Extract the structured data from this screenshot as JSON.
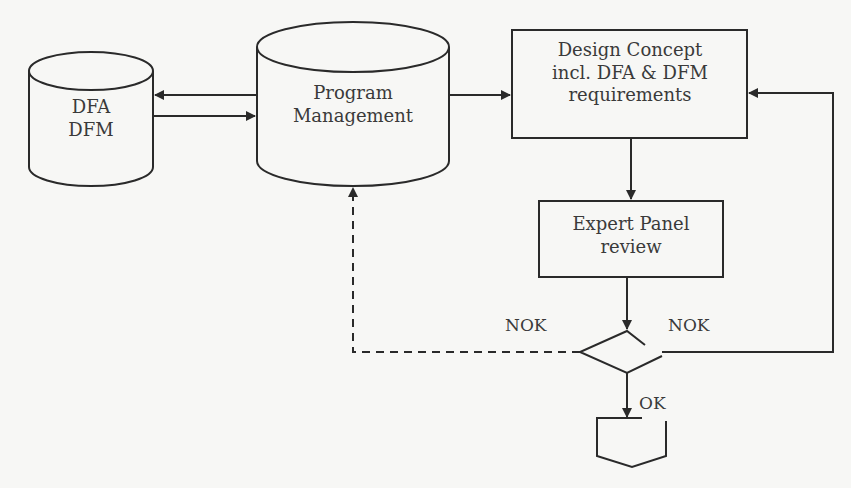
{
  "diagram": {
    "nodes": {
      "dfa_dfm": {
        "lines": [
          "DFA",
          "DFM"
        ],
        "shape": "cylinder"
      },
      "program_management": {
        "lines": [
          "Program",
          "Management"
        ],
        "shape": "cylinder"
      },
      "design_concept": {
        "lines": [
          "Design Concept",
          "incl. DFA & DFM",
          "requirements"
        ],
        "shape": "rectangle"
      },
      "expert_panel": {
        "lines": [
          "Expert Panel",
          "review"
        ],
        "shape": "rectangle"
      },
      "decision": {
        "shape": "diamond"
      },
      "offpage_connector": {
        "shape": "off-page-connector"
      }
    },
    "edge_labels": {
      "nok_left": "NOK",
      "nok_right": "NOK",
      "ok": "OK"
    },
    "colors": {
      "stroke": "#2a2a2a",
      "background": "#f7f7f5",
      "text": "#3a3a3a"
    }
  }
}
